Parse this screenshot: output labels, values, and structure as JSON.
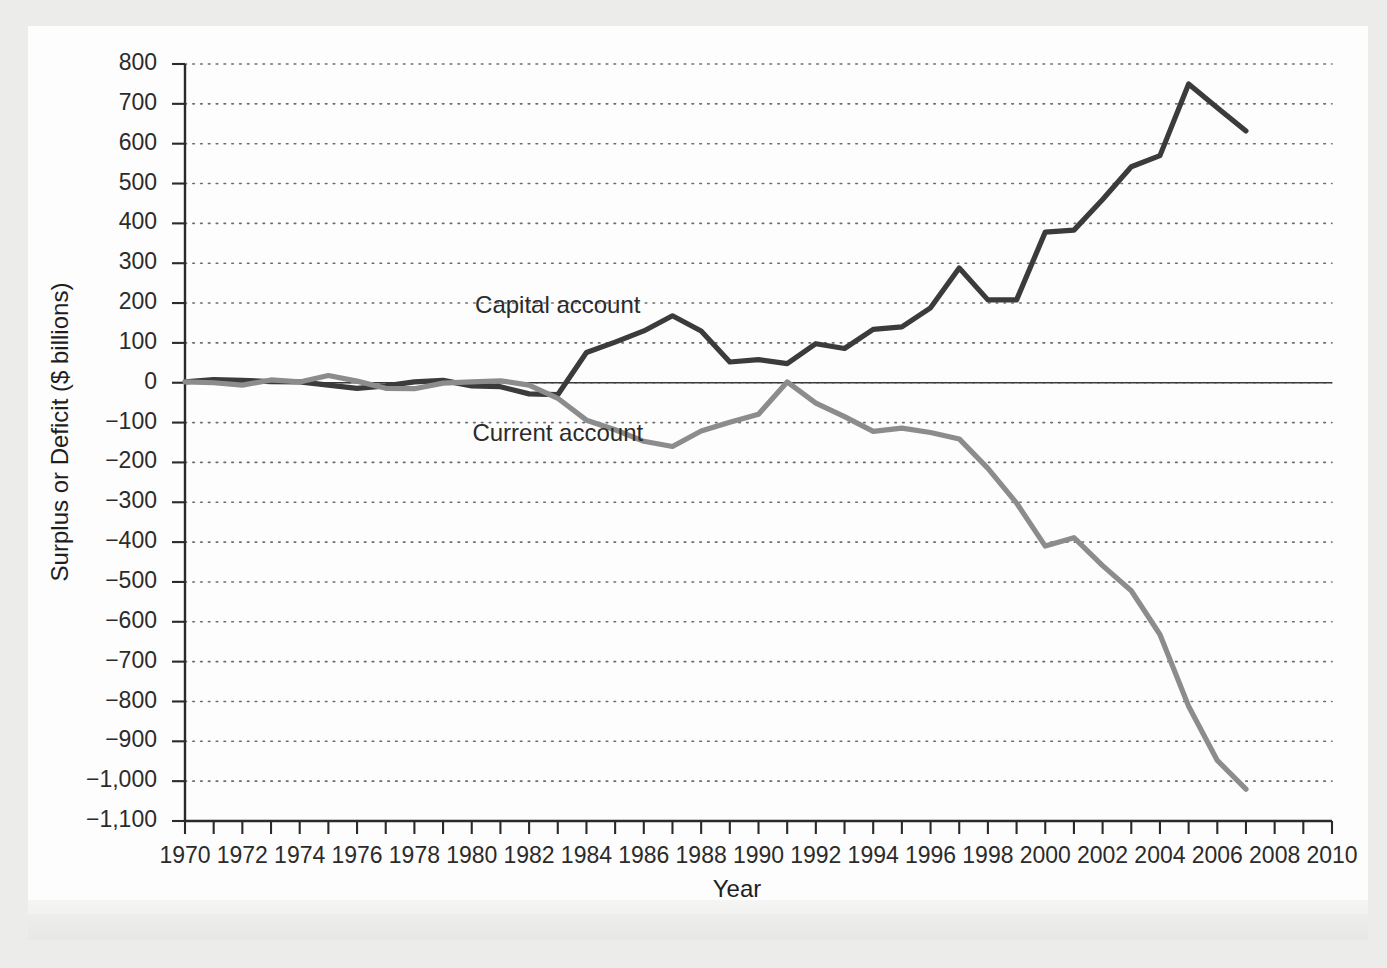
{
  "chart_data": {
    "type": "line",
    "title": "",
    "xlabel": "Year",
    "ylabel": "Surplus or Deficit ($ billions)",
    "xlim": [
      1970,
      2010
    ],
    "ylim": [
      -1100,
      800
    ],
    "grid": true,
    "legend_position": "inline-annotation",
    "x": [
      1970,
      1971,
      1972,
      1973,
      1974,
      1975,
      1976,
      1977,
      1978,
      1979,
      1980,
      1981,
      1982,
      1983,
      1984,
      1985,
      1986,
      1987,
      1988,
      1989,
      1990,
      1991,
      1992,
      1993,
      1994,
      1995,
      1996,
      1997,
      1998,
      1999,
      2000,
      2001,
      2002,
      2003,
      2004,
      2005,
      2006,
      2007
    ],
    "xticks_major": [
      1970,
      1972,
      1974,
      1976,
      1978,
      1980,
      1982,
      1984,
      1986,
      1988,
      1990,
      1992,
      1994,
      1996,
      1998,
      2000,
      2002,
      2004,
      2006,
      2008,
      2010
    ],
    "xtick_labels": [
      "1970",
      "1972",
      "1974",
      "1976",
      "1978",
      "1980",
      "1982",
      "1984",
      "1986",
      "1988",
      "1990",
      "1992",
      "1994",
      "1996",
      "1998",
      "2000",
      "2002",
      "2004",
      "2006",
      "2008",
      "2010"
    ],
    "yticks": [
      800,
      700,
      600,
      500,
      400,
      300,
      200,
      100,
      0,
      -100,
      -200,
      -300,
      -400,
      -500,
      -600,
      -700,
      -800,
      -900,
      -1000,
      -1100
    ],
    "ytick_labels": [
      "800",
      "700",
      "600",
      "500",
      "400",
      "300",
      "200",
      "100",
      "0",
      "−100",
      "−200",
      "−300",
      "−400",
      "−500",
      "−600",
      "−700",
      "−800",
      "−900",
      "−1,000",
      "−1,100"
    ],
    "series": [
      {
        "name": "Capital account",
        "color": "#3b3b3b",
        "label_x": 1983.0,
        "label_y": 175,
        "values": [
          2,
          8,
          6,
          3,
          2,
          -6,
          -14,
          -8,
          2,
          6,
          -8,
          -10,
          -28,
          -30,
          76,
          102,
          130,
          168,
          130,
          52,
          58,
          48,
          98,
          86,
          134,
          140,
          188,
          288,
          208,
          208,
          378,
          383,
          460,
          542,
          570,
          750,
          690,
          632
        ]
      },
      {
        "name": "Current account",
        "color": "#8c8c8c",
        "label_x": 1983.0,
        "label_y": -145,
        "values": [
          2,
          0,
          -6,
          7,
          2,
          18,
          4,
          -14,
          -15,
          -1,
          2,
          5,
          -6,
          -39,
          -94,
          -118,
          -147,
          -160,
          -121,
          -99,
          -79,
          2,
          -51,
          -85,
          -122,
          -114,
          -125,
          -141,
          -215,
          -302,
          -410,
          -389,
          -459,
          -522,
          -632,
          -812,
          -948,
          -1020
        ]
      }
    ]
  },
  "annotations": {
    "capital_label": "Capital account",
    "current_label": "Current account"
  },
  "axis": {
    "x_title": "Year",
    "y_title": "Surplus or Deficit ($ billions)"
  }
}
